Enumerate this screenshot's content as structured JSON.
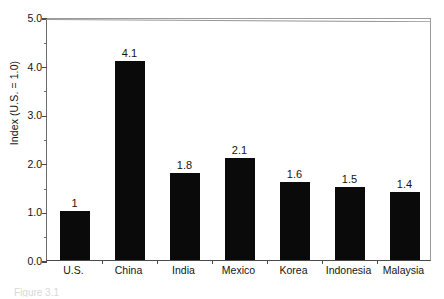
{
  "chart_data": {
    "type": "bar",
    "title": "",
    "subtitle": "",
    "xlabel": "",
    "ylabel": "Index (U.S. = 1.0)",
    "categories": [
      "U.S.",
      "China",
      "India",
      "Mexico",
      "Korea",
      "Indonesia",
      "Malaysia"
    ],
    "values": [
      1.0,
      4.1,
      1.8,
      2.1,
      1.6,
      1.5,
      1.4
    ],
    "value_labels": [
      "1",
      "4.1",
      "1.8",
      "2.1",
      "1.6",
      "1.5",
      "1.4"
    ],
    "ylim": [
      0.0,
      5.0
    ],
    "ytick_labels": [
      "0.0",
      "1.0",
      "2.0",
      "3.0",
      "4.0",
      "5.0"
    ],
    "ytick_values": [
      0.0,
      1.0,
      2.0,
      3.0,
      4.0,
      5.0
    ],
    "yminor_tick_values": [
      0.5,
      1.5,
      2.5,
      3.5,
      4.5
    ],
    "grid": false,
    "legend": null,
    "bar_color": "#0a0a0a",
    "frame_color": "#6d6d6d",
    "background": "#ffffff"
  },
  "caption": {
    "text": "Figure 3.1"
  }
}
